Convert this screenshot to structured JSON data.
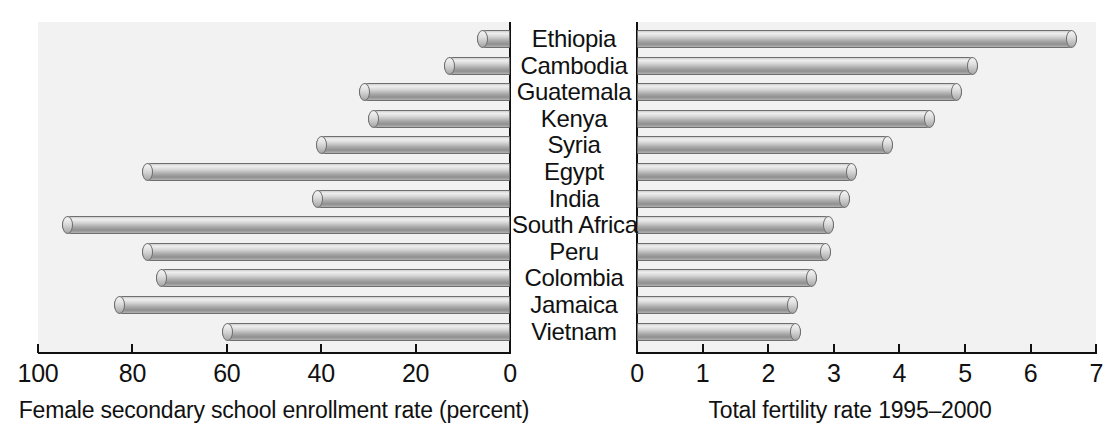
{
  "chart_data": {
    "type": "bar",
    "title": "",
    "orientation": "horizontal",
    "panels": [
      {
        "id": "left",
        "xlabel": "Female secondary school enrollment rate (percent)",
        "xlim": [
          100,
          0
        ],
        "reversed": true,
        "ticks": [
          "100",
          "80",
          "60",
          "40",
          "20",
          "0"
        ],
        "tick_values": [
          100,
          80,
          60,
          40,
          20,
          0
        ],
        "series_name": "Female secondary school enrollment rate (percent)",
        "values": [
          7,
          14,
          32,
          30,
          41,
          78,
          42,
          95,
          78,
          75,
          84,
          61
        ]
      },
      {
        "id": "right",
        "xlabel": "Total fertility rate 1995–2000",
        "xlim": [
          0,
          7
        ],
        "reversed": false,
        "ticks": [
          "0",
          "1",
          "2",
          "3",
          "4",
          "5",
          "6",
          "7"
        ],
        "tick_values": [
          0,
          1,
          2,
          3,
          4,
          5,
          6,
          7
        ],
        "series_name": "Total fertility rate 1995–2000",
        "values": [
          6.7,
          5.2,
          4.95,
          4.55,
          3.9,
          3.35,
          3.25,
          3.0,
          2.95,
          2.75,
          2.45,
          2.5
        ]
      }
    ],
    "categories": [
      "Ethiopia",
      "Cambodia",
      "Guatemala",
      "Kenya",
      "Syria",
      "Egypt",
      "India",
      "South Africa",
      "Peru",
      "Colombia",
      "Jamaica",
      "Vietnam"
    ],
    "grid": false,
    "legend": null,
    "colors": {
      "background": "#ffffff",
      "panel": "#f2f2f2",
      "bar_light": "#efefef",
      "bar_dark": "#8f8f8f",
      "axis": "#111111",
      "text": "#111111"
    }
  }
}
